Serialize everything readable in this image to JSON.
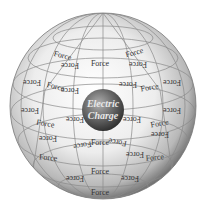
{
  "diagram": {
    "center": {
      "line1": "Electric",
      "line2": "Charge"
    },
    "label": "Force",
    "force_labels": [
      {
        "x": 62,
        "y": 58,
        "r": 15,
        "flip": false
      },
      {
        "x": 70,
        "y": 63,
        "r": 0,
        "flip": true
      },
      {
        "x": 100,
        "y": 66,
        "r": 0,
        "flip": false
      },
      {
        "x": 135,
        "y": 55,
        "r": -15,
        "flip": false
      },
      {
        "x": 138,
        "y": 62,
        "r": 0,
        "flip": true
      },
      {
        "x": 32,
        "y": 80,
        "r": 0,
        "flip": true
      },
      {
        "x": 172,
        "y": 80,
        "r": 0,
        "flip": true
      },
      {
        "x": 55,
        "y": 89,
        "r": 15,
        "flip": false
      },
      {
        "x": 70,
        "y": 88,
        "r": 0,
        "flip": true
      },
      {
        "x": 128,
        "y": 82,
        "r": 0,
        "flip": true
      },
      {
        "x": 150,
        "y": 90,
        "r": -10,
        "flip": false
      },
      {
        "x": 30,
        "y": 108,
        "r": 0,
        "flip": true
      },
      {
        "x": 172,
        "y": 108,
        "r": 0,
        "flip": true
      },
      {
        "x": 75,
        "y": 117,
        "r": 0,
        "flip": true
      },
      {
        "x": 132,
        "y": 117,
        "r": 0,
        "flip": true
      },
      {
        "x": 45,
        "y": 126,
        "r": 10,
        "flip": false
      },
      {
        "x": 48,
        "y": 136,
        "r": 0,
        "flip": true
      },
      {
        "x": 160,
        "y": 126,
        "r": -10,
        "flip": false
      },
      {
        "x": 160,
        "y": 132,
        "r": 0,
        "flip": true
      },
      {
        "x": 82,
        "y": 143,
        "r": -10,
        "flip": true
      },
      {
        "x": 100,
        "y": 145,
        "r": 0,
        "flip": false
      },
      {
        "x": 118,
        "y": 140,
        "r": 10,
        "flip": true
      },
      {
        "x": 48,
        "y": 160,
        "r": 5,
        "flip": false
      },
      {
        "x": 135,
        "y": 152,
        "r": 0,
        "flip": true
      },
      {
        "x": 155,
        "y": 160,
        "r": -5,
        "flip": false
      },
      {
        "x": 75,
        "y": 176,
        "r": 0,
        "flip": true
      },
      {
        "x": 100,
        "y": 174,
        "r": 0,
        "flip": false
      },
      {
        "x": 130,
        "y": 176,
        "r": 0,
        "flip": true
      },
      {
        "x": 100,
        "y": 195,
        "r": 0,
        "flip": false
      }
    ],
    "colors": {
      "sphere_light": "#ffffff",
      "sphere_dark": "#6a6a6a",
      "grid": "#8a8a8a",
      "core_light": "#b0b0b0",
      "core_dark": "#2a2a2a"
    }
  }
}
